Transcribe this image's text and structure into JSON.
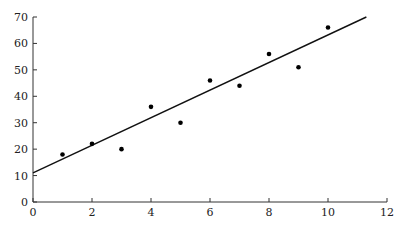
{
  "chart_data": {
    "type": "scatter",
    "title": "",
    "xlabel": "",
    "ylabel": "",
    "xlim": [
      0,
      12
    ],
    "ylim": [
      0,
      70
    ],
    "grid": false,
    "xticks": [
      0,
      2,
      4,
      6,
      8,
      10,
      12
    ],
    "yticks": [
      0,
      10,
      20,
      30,
      40,
      50,
      60,
      70
    ],
    "series": [
      {
        "name": "data",
        "x": [
          1,
          2,
          3,
          4,
          5,
          6,
          7,
          8,
          9,
          10
        ],
        "y": [
          18,
          22,
          20,
          36,
          30,
          46,
          44,
          56,
          51,
          66
        ]
      }
    ],
    "fit_line": {
      "name": "regression line",
      "x": [
        0,
        11.3
      ],
      "y": [
        11,
        70
      ]
    },
    "colors": {
      "points": "#000000",
      "line": "#111111",
      "axes": "#333333"
    }
  }
}
